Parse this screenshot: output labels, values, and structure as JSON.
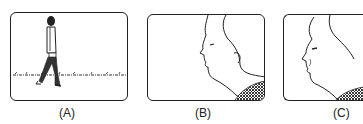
{
  "panels": [
    {
      "id": "A",
      "label": "(A)",
      "description": "wide shot: person walking across grass"
    },
    {
      "id": "B",
      "label": "(B)",
      "description": "close-up: face in profile"
    },
    {
      "id": "C",
      "label": "(C)",
      "description": "closer close-up: face in profile, cropped"
    }
  ],
  "colors": {
    "ink": "#222222",
    "background": "#ffffff"
  }
}
